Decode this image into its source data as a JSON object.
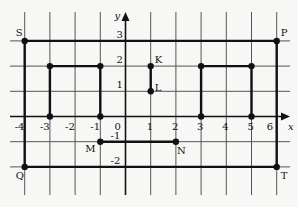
{
  "diagram": {
    "type": "coordinate-grid",
    "axes": {
      "x_label": "x",
      "y_label": "y",
      "x_ticks": [
        "-4",
        "-3",
        "-2",
        "-1",
        "0",
        "1",
        "2",
        "3",
        "4",
        "5",
        "6"
      ],
      "y_ticks": [
        "3",
        "2",
        "1",
        "-1",
        "-2"
      ]
    },
    "points": [
      {
        "label": "S",
        "x": -4,
        "y": 3
      },
      {
        "label": "P",
        "x": 6,
        "y": 3
      },
      {
        "label": "T",
        "x": 6,
        "y": -2
      },
      {
        "label": "Q",
        "x": -4,
        "y": -2
      },
      {
        "label": "K",
        "x": 1,
        "y": 2
      },
      {
        "label": "L",
        "x": 1,
        "y": 1
      },
      {
        "label": "M",
        "x": -1,
        "y": -1
      },
      {
        "label": "N",
        "x": 2,
        "y": -1
      }
    ],
    "shapes": [
      {
        "name": "rectangle-SPTQ",
        "points": [
          [
            -4,
            3
          ],
          [
            6,
            3
          ],
          [
            6,
            -2
          ],
          [
            -4,
            -2
          ]
        ],
        "closed": true
      },
      {
        "name": "left-bracket",
        "points": [
          [
            -3,
            0
          ],
          [
            -3,
            2
          ],
          [
            -1,
            2
          ],
          [
            -1,
            0
          ]
        ],
        "closed": false
      },
      {
        "name": "right-bracket",
        "points": [
          [
            3,
            0
          ],
          [
            3,
            2
          ],
          [
            5,
            2
          ],
          [
            5,
            0
          ]
        ],
        "closed": false
      },
      {
        "name": "segment-KL",
        "points": [
          [
            1,
            2
          ],
          [
            1,
            1
          ]
        ],
        "closed": false
      },
      {
        "name": "segment-MN",
        "points": [
          [
            -1,
            -1
          ],
          [
            2,
            -1
          ]
        ],
        "closed": false
      }
    ],
    "unlabeled_points": [
      [
        -3,
        0
      ],
      [
        -3,
        2
      ],
      [
        -1,
        2
      ],
      [
        -1,
        0
      ],
      [
        3,
        0
      ],
      [
        3,
        2
      ],
      [
        5,
        2
      ],
      [
        5,
        0
      ]
    ]
  }
}
